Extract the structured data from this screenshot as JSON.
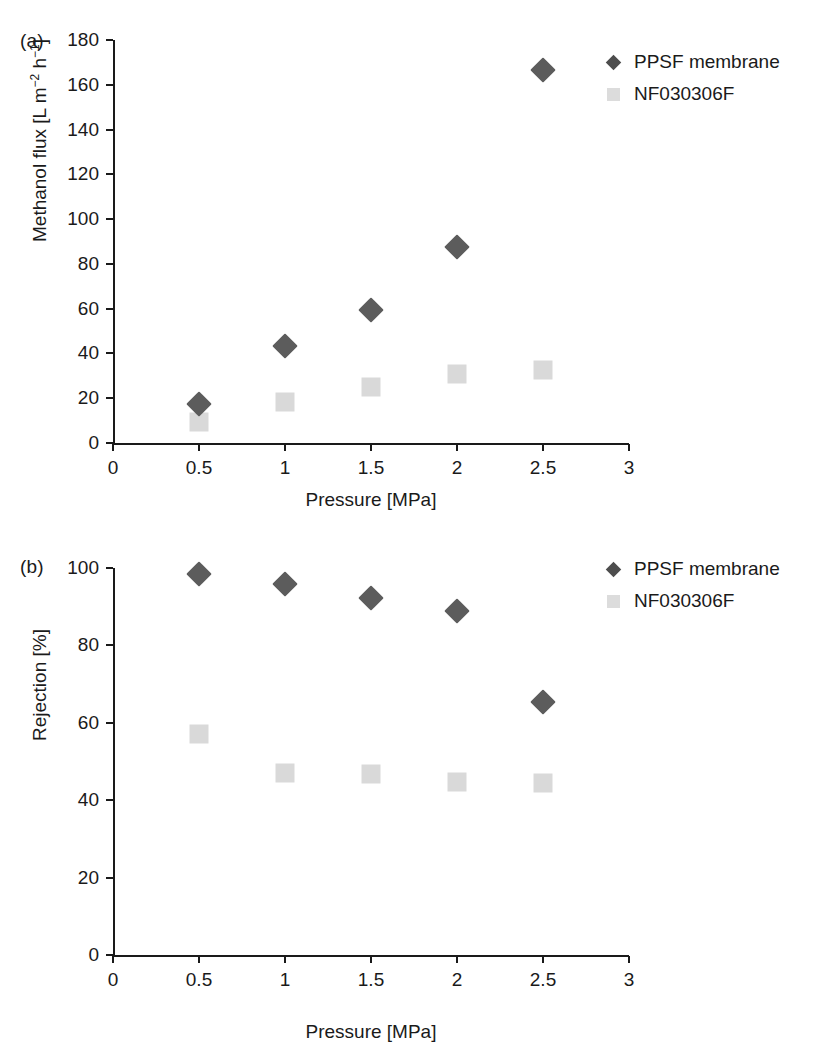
{
  "figure": {
    "width": 825,
    "height": 1051,
    "background": "#ffffff",
    "marker_colors": {
      "ppsf_diamond": "#5c5c5c",
      "nf_square": "#d9d9d9",
      "axis": "#1a1a1a"
    }
  },
  "chart_data": [
    {
      "type": "scatter",
      "panel_label": "(a)",
      "title": "",
      "xlabel": "Pressure [MPa]",
      "ylabel": "Methanol flux [L m⁻² h⁻¹]",
      "ylabel_parts": {
        "pre": "Methanol flux [L m",
        "sup1": "−2",
        "mid": " h",
        "sup2": "−1",
        "post": "]"
      },
      "x": [
        0.5,
        1,
        1.5,
        2,
        2.5
      ],
      "xlim": [
        0,
        3
      ],
      "ylim": [
        0,
        180
      ],
      "xticks": [
        0,
        0.5,
        1,
        1.5,
        2,
        2.5,
        3
      ],
      "xticklabels": [
        "0",
        "0.5",
        "1",
        "1.5",
        "2",
        "2.5",
        "3"
      ],
      "yticks": [
        0,
        20,
        40,
        60,
        80,
        100,
        120,
        140,
        160,
        180
      ],
      "yticklabels": [
        "0",
        "20",
        "40",
        "60",
        "80",
        "100",
        "120",
        "140",
        "160",
        "180"
      ],
      "grid": false,
      "legend_position": "right-top",
      "series": [
        {
          "name": "PPSF membrane",
          "marker": "diamond",
          "color": "#5c5c5c",
          "values": [
            17.5,
            43.5,
            59.5,
            87.5,
            166.5
          ]
        },
        {
          "name": "NF030306F",
          "marker": "square",
          "color": "#d9d9d9",
          "values": [
            9.5,
            18.5,
            25.0,
            31.0,
            32.5
          ]
        }
      ]
    },
    {
      "type": "scatter",
      "panel_label": "(b)",
      "title": "",
      "xlabel": "Pressure [MPa]",
      "ylabel": "Rejection [%]",
      "x": [
        0.5,
        1,
        1.5,
        2,
        2.5
      ],
      "xlim": [
        0,
        3
      ],
      "ylim": [
        0,
        100
      ],
      "xticks": [
        0,
        0.5,
        1,
        1.5,
        2,
        2.5,
        3
      ],
      "xticklabels": [
        "0",
        "0.5",
        "1",
        "1.5",
        "2",
        "2.5",
        "3"
      ],
      "yticks": [
        0,
        20,
        40,
        60,
        80,
        100
      ],
      "yticklabels": [
        "0",
        "20",
        "40",
        "60",
        "80",
        "100"
      ],
      "grid": false,
      "legend_position": "right-top",
      "series": [
        {
          "name": "PPSF membrane",
          "marker": "diamond",
          "color": "#5c5c5c",
          "values": [
            98.5,
            95.8,
            92.2,
            89.0,
            65.5
          ]
        },
        {
          "name": "NF030306F",
          "marker": "square",
          "color": "#d9d9d9",
          "values": [
            57.2,
            47.0,
            46.7,
            44.8,
            44.5
          ]
        }
      ]
    }
  ]
}
